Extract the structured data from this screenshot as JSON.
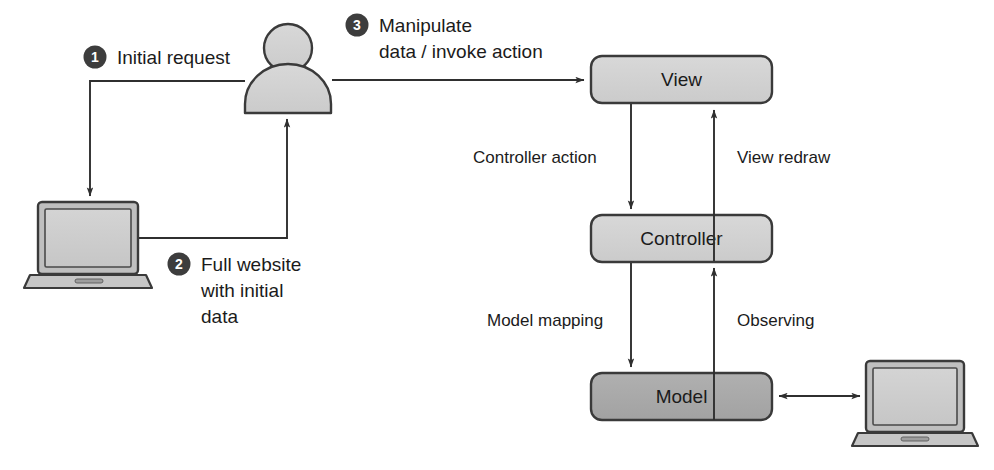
{
  "diagram": {
    "colors": {
      "box_light_fill": "#d2d2d2",
      "box_dark_fill": "#a9a9a9",
      "stroke": "#3a3a3a",
      "badge_fill": "#3d3d3d",
      "badge_text": "#ffffff",
      "text": "#1b1b1b",
      "background": "#ffffff"
    },
    "nodes": [
      {
        "id": "view",
        "label": "View",
        "shape": "rounded-rect",
        "fill": "light"
      },
      {
        "id": "controller",
        "label": "Controller",
        "shape": "rounded-rect",
        "fill": "light"
      },
      {
        "id": "model",
        "label": "Model",
        "shape": "rounded-rect",
        "fill": "dark"
      }
    ],
    "actors": [
      {
        "id": "user",
        "icon": "person-icon",
        "label": ""
      },
      {
        "id": "client-laptop",
        "icon": "laptop-icon",
        "label": ""
      },
      {
        "id": "server-laptop",
        "icon": "laptop-icon",
        "label": ""
      }
    ],
    "steps": [
      {
        "number": "1",
        "lines": [
          "Initial request"
        ]
      },
      {
        "number": "2",
        "lines": [
          "Full website",
          "with initial",
          "data"
        ]
      },
      {
        "number": "3",
        "lines": [
          "Manipulate",
          "data / invoke action"
        ]
      }
    ],
    "edges": [
      {
        "id": "controller-action",
        "label": "Controller action",
        "from": "view",
        "to": "controller"
      },
      {
        "id": "view-redraw",
        "label": "View redraw",
        "from": "controller",
        "to": "view"
      },
      {
        "id": "model-mapping",
        "label": "Model mapping",
        "from": "controller",
        "to": "model"
      },
      {
        "id": "observing",
        "label": "Observing",
        "from": "model",
        "to": "controller"
      },
      {
        "id": "model-storage",
        "label": "",
        "from": "model",
        "to": "server-laptop"
      }
    ]
  }
}
